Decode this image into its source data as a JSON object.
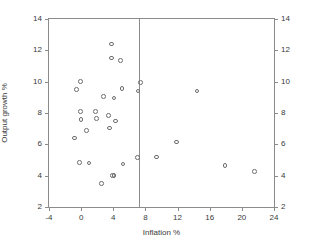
{
  "chart_data": {
    "type": "scatter",
    "title": "",
    "xlabel": "Inflation %",
    "ylabel": "Output growth %",
    "xlim": [
      -4,
      24
    ],
    "ylim": [
      2,
      14
    ],
    "xticks": [
      -4,
      0,
      4,
      8,
      12,
      16,
      20,
      24
    ],
    "yticks": [
      2,
      4,
      6,
      8,
      10,
      12,
      14
    ],
    "yticks_right": [
      2,
      4,
      6,
      8,
      10,
      12,
      14
    ],
    "xtick_labels": [
      "-4",
      "0",
      "4",
      "8",
      "12",
      "16",
      "20",
      "24"
    ],
    "ytick_labels": [
      "2",
      "4",
      "6",
      "8",
      "10",
      "12",
      "14"
    ],
    "ytick_labels_right": [
      "2",
      "4",
      "6",
      "8",
      "10",
      "12",
      "14"
    ],
    "grid": false,
    "legend": null,
    "marker": "open-circle",
    "marker_color": "#6e6e6e",
    "frame_color": "#8b8b8b",
    "annotations": [
      {
        "type": "vertical-line",
        "x": 7.2,
        "color": "#8b8b8b"
      }
    ],
    "points": [
      {
        "x": -0.6,
        "y": 9.5
      },
      {
        "x": -0.8,
        "y": 6.4
      },
      {
        "x": -0.1,
        "y": 10.0
      },
      {
        "x": -0.1,
        "y": 8.1
      },
      {
        "x": 0.0,
        "y": 7.6
      },
      {
        "x": -0.2,
        "y": 4.85
      },
      {
        "x": 0.7,
        "y": 6.9
      },
      {
        "x": 1.0,
        "y": 4.8
      },
      {
        "x": 1.8,
        "y": 8.1
      },
      {
        "x": 1.9,
        "y": 7.65
      },
      {
        "x": 2.5,
        "y": 3.5
      },
      {
        "x": 2.8,
        "y": 9.05
      },
      {
        "x": 3.4,
        "y": 7.85
      },
      {
        "x": 3.5,
        "y": 7.05
      },
      {
        "x": 3.8,
        "y": 12.4
      },
      {
        "x": 3.8,
        "y": 11.5
      },
      {
        "x": 3.9,
        "y": 4.0
      },
      {
        "x": 4.1,
        "y": 4.0
      },
      {
        "x": 4.1,
        "y": 8.95
      },
      {
        "x": 4.3,
        "y": 7.5
      },
      {
        "x": 4.9,
        "y": 11.35
      },
      {
        "x": 5.1,
        "y": 9.55
      },
      {
        "x": 5.2,
        "y": 4.75
      },
      {
        "x": 7.0,
        "y": 5.15
      },
      {
        "x": 7.1,
        "y": 9.4
      },
      {
        "x": 7.4,
        "y": 9.95
      },
      {
        "x": 9.4,
        "y": 5.2
      },
      {
        "x": 11.9,
        "y": 6.15
      },
      {
        "x": 14.4,
        "y": 9.4
      },
      {
        "x": 17.9,
        "y": 4.65
      },
      {
        "x": 21.6,
        "y": 4.25
      }
    ]
  }
}
